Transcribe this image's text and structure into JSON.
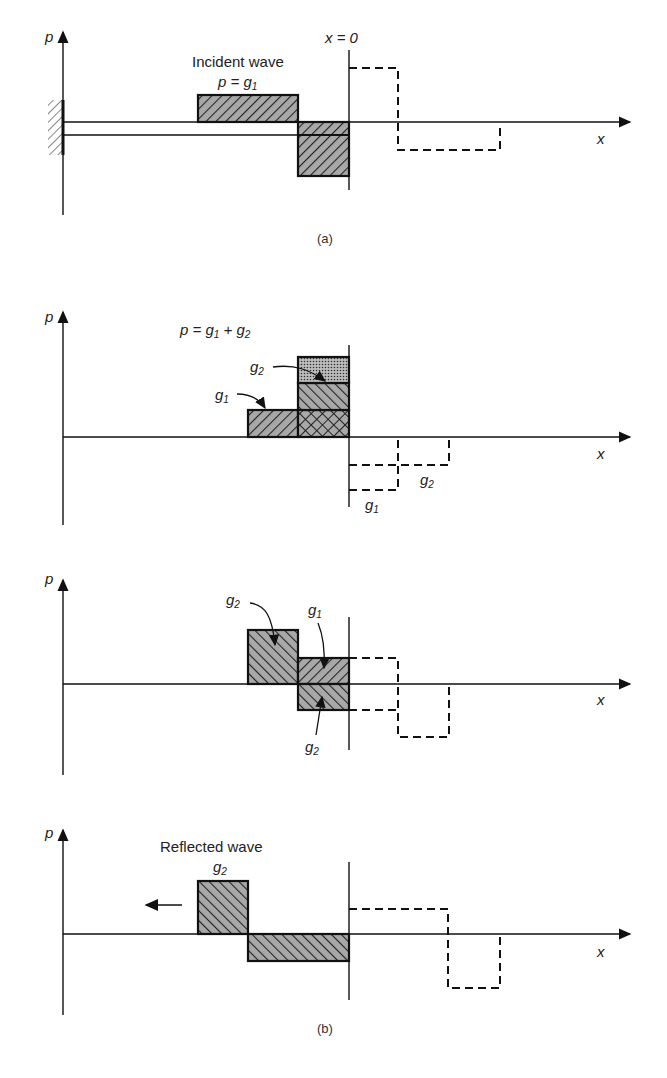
{
  "figure": {
    "caption_a": "(a)",
    "caption_b": "(b)",
    "axis_p": "p",
    "axis_x": "x",
    "boundary_label": "x = 0",
    "colors": {
      "ink": "#1a1a1a",
      "hatch_fill": "#9a9a9a"
    }
  },
  "panel_a": {
    "title": "Incident wave",
    "eq": "p = g",
    "eq_sub": "1"
  },
  "panel_b1": {
    "eq_p": "p = g",
    "eq_sub1": "1",
    "eq_plus": " + g",
    "eq_sub2": "2",
    "g1_label": "g",
    "g1_sub": "1",
    "g2_label": "g",
    "g2_sub": "2",
    "dash_g1": "g",
    "dash_g1_sub": "1",
    "dash_g2": "g",
    "dash_g2_sub": "2"
  },
  "panel_b2": {
    "g2_top": "g",
    "g2_top_sub": "2",
    "g1": "g",
    "g1_sub": "1",
    "g2_bottom": "g",
    "g2_bottom_sub": "2"
  },
  "panel_b3": {
    "title": "Reflected wave",
    "g2": "g",
    "g2_sub": "2",
    "arrow": "left"
  }
}
